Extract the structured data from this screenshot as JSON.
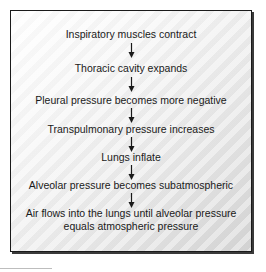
{
  "diagram": {
    "type": "flowchart",
    "direction": "top-to-bottom",
    "steps": [
      {
        "label": "Inspiratory muscles contract"
      },
      {
        "label": "Thoracic cavity expands"
      },
      {
        "label": "Pleural pressure becomes more negative"
      },
      {
        "label": "Transpulmonary pressure increases"
      },
      {
        "label": "Lungs inflate"
      },
      {
        "label": "Alveolar pressure becomes subatmospheric"
      },
      {
        "label_line1": "Air flows into the lungs until alveolar pressure",
        "label_line2": "equals atmospheric pressure"
      }
    ],
    "connector": "down-arrow-icon",
    "colors": {
      "border": "#1a1a1a",
      "text": "#1a1a1a",
      "background_top": "#ffffff",
      "background_bottom": "#d6d6d6"
    }
  }
}
